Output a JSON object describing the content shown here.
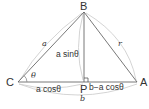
{
  "diagram": {
    "type": "triangle-law-of-cosines-derivation",
    "points": {
      "B": {
        "label": "B",
        "x": 84,
        "y": 12
      },
      "C": {
        "label": "C",
        "x": 18,
        "y": 82
      },
      "A": {
        "label": "A",
        "x": 137,
        "y": 82
      },
      "P": {
        "label": "P",
        "x": 84,
        "y": 82
      }
    },
    "labels": {
      "side_CB": "a",
      "side_BA": "r",
      "height_BP": "a sinθ",
      "angle_C": "θ",
      "segment_CP": "a cosθ",
      "segment_PA": "b−a cosθ",
      "side_CA": "b"
    },
    "colors": {
      "line": "#555555",
      "brace": "#cccccc",
      "text": "#333333"
    }
  }
}
